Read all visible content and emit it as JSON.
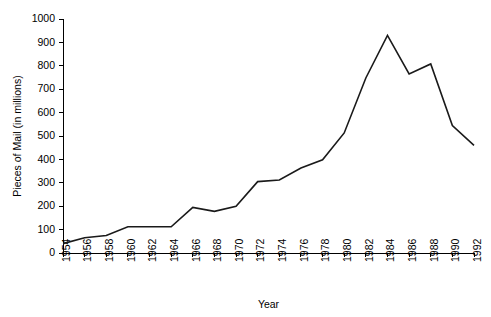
{
  "chart_data": {
    "type": "line",
    "title": "",
    "xlabel": "Year",
    "ylabel": "Pieces of Mail (in millions)",
    "xlim": [
      1954,
      1992
    ],
    "ylim": [
      0,
      1000
    ],
    "ytick_step": 100,
    "xtick_step": 2,
    "grid": false,
    "legend": "none",
    "line_color": "#1a1a1a",
    "axis_color": "#000000",
    "background": "#ffffff",
    "categories": [
      "1954",
      "1956",
      "1958",
      "1960",
      "1962",
      "1964",
      "1966",
      "1968",
      "1970",
      "1972",
      "1974",
      "1976",
      "1978",
      "1980",
      "1982",
      "1984",
      "1986",
      "1988",
      "1990",
      "1992"
    ],
    "x": [
      1954,
      1956,
      1958,
      1960,
      1962,
      1964,
      1966,
      1968,
      1970,
      1972,
      1974,
      1976,
      1978,
      1980,
      1982,
      1984,
      1986,
      1988,
      1990,
      1992
    ],
    "values": [
      40,
      65,
      75,
      112,
      112,
      112,
      195,
      178,
      200,
      305,
      312,
      363,
      398,
      513,
      748,
      930,
      765,
      808,
      545,
      460
    ],
    "yticks": [
      0,
      100,
      200,
      300,
      400,
      500,
      600,
      700,
      800,
      900,
      1000
    ],
    "ytick_labels": [
      "0",
      "100",
      "200",
      "300",
      "400",
      "500",
      "600",
      "700",
      "800",
      "900",
      "1000"
    ],
    "series": [
      {
        "name": "Pieces of Mail",
        "values": [
          40,
          65,
          75,
          112,
          112,
          112,
          195,
          178,
          200,
          305,
          312,
          363,
          398,
          513,
          748,
          930,
          765,
          808,
          545,
          460
        ]
      }
    ]
  }
}
